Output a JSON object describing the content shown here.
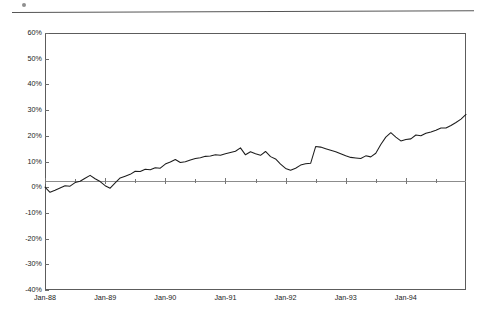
{
  "figure": {
    "top_rule": "horizontal-rule",
    "mark": "page-mark"
  },
  "chart_data": {
    "type": "line",
    "title": "",
    "subtitle": "",
    "xlabel": "",
    "ylabel": "",
    "grid": false,
    "legend": "none",
    "ylim": [
      -40,
      60
    ],
    "ytick_labels": [
      "60%",
      "50%",
      "40%",
      "30%",
      "20%",
      "10%",
      "0%",
      "-10%",
      "-20%",
      "-30%",
      "-40%"
    ],
    "ytick_values": [
      60,
      50,
      40,
      30,
      20,
      10,
      0,
      -10,
      -20,
      -30,
      -40
    ],
    "xtick_labels": [
      "Jan-88",
      "Jan-89",
      "Jan-90",
      "Jan-91",
      "Jan-92",
      "Jan-93",
      "Jan-94"
    ],
    "xtick_values": [
      0,
      12,
      24,
      36,
      48,
      60,
      72
    ],
    "xlim": [
      0,
      84
    ],
    "series": [
      {
        "name": "cumulative return",
        "color": "#1d1d1d",
        "x": [
          0,
          1,
          2,
          3,
          4,
          5,
          6,
          7,
          8,
          9,
          10,
          11,
          12,
          13,
          14,
          15,
          16,
          17,
          18,
          19,
          20,
          21,
          22,
          23,
          24,
          25,
          26,
          27,
          28,
          29,
          30,
          31,
          32,
          33,
          34,
          35,
          36,
          37,
          38,
          39,
          40,
          41,
          42,
          43,
          44,
          45,
          46,
          47,
          48,
          49,
          50,
          51,
          52,
          53,
          54,
          55,
          56,
          57,
          58,
          59,
          60,
          61,
          62,
          63,
          64,
          65,
          66,
          67,
          68,
          69,
          70,
          71,
          72,
          73,
          74,
          75,
          76,
          77,
          78,
          79,
          80,
          81,
          82,
          83,
          84
        ],
        "values": [
          0.0,
          -2.0,
          -1.2,
          -0.3,
          0.6,
          0.4,
          1.8,
          2.3,
          3.5,
          4.6,
          3.3,
          2.2,
          0.6,
          -0.4,
          1.7,
          3.6,
          4.3,
          5.0,
          6.2,
          6.1,
          7.0,
          6.8,
          7.6,
          7.4,
          9.0,
          9.8,
          10.8,
          9.6,
          9.9,
          10.6,
          11.2,
          11.5,
          12.0,
          12.1,
          12.6,
          12.4,
          13.0,
          13.5,
          14.0,
          15.3,
          12.6,
          13.8,
          13.0,
          12.4,
          13.9,
          11.9,
          11.0,
          9.0,
          7.3,
          6.6,
          7.4,
          8.6,
          9.1,
          9.3,
          15.8,
          15.6,
          15.0,
          14.4,
          13.8,
          13.0,
          12.2,
          11.6,
          11.4,
          11.2,
          12.2,
          11.8,
          13.2,
          16.6,
          19.5,
          21.2,
          19.5,
          18.0,
          18.6,
          18.8,
          20.3,
          20.0,
          21.0,
          21.5,
          22.2,
          23.0,
          23.0,
          24.0,
          25.2,
          26.5,
          28.3
        ]
      }
    ]
  },
  "axis_labels": {
    "y": [
      "60%",
      "50%",
      "40%",
      "30%",
      "20%",
      "10%",
      "0%",
      "-10%",
      "-20%",
      "-30%",
      "-40%"
    ],
    "x": [
      "Jan-88",
      "Jan-89",
      "Jan-90",
      "Jan-91",
      "Jan-92",
      "Jan-93",
      "Jan-94"
    ]
  }
}
